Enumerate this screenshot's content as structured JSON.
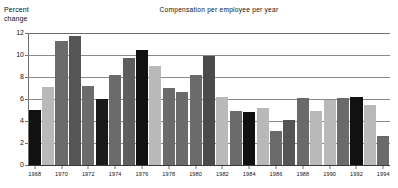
{
  "chart_data": {
    "type": "bar",
    "title": "Compensation per employee per year",
    "ylabel": "Percent\nchange",
    "xlabel": "",
    "ylim": [
      0,
      12
    ],
    "yticks": [
      0,
      2,
      4,
      6,
      8,
      10,
      12
    ],
    "ytick_labels": [
      "0",
      "2",
      "4",
      "6",
      "8",
      "10",
      "12"
    ],
    "grid": true,
    "legend": "none",
    "xtick_labels": [
      "1968",
      "1970",
      "1972",
      "1974",
      "1976",
      "1978",
      "1980",
      "1982",
      "1984",
      "1986",
      "1988",
      "1990",
      "1992",
      "1994"
    ],
    "categories": [
      "1968",
      "1969",
      "1970",
      "1971",
      "1972",
      "1973",
      "1974",
      "1975",
      "1976",
      "1977",
      "1978",
      "1979",
      "1980",
      "1981",
      "1982",
      "1983",
      "1984",
      "1985",
      "1986",
      "1987",
      "1988",
      "1989",
      "1990",
      "1991",
      "1992",
      "1993",
      "1994"
    ],
    "values": [
      5.0,
      7.1,
      11.3,
      11.7,
      7.2,
      6.0,
      8.2,
      9.7,
      10.5,
      9.0,
      7.0,
      6.6,
      8.2,
      9.9,
      6.2,
      4.9,
      4.8,
      5.2,
      3.1,
      4.1,
      6.1,
      4.9,
      5.9,
      6.1,
      6.2,
      5.5,
      2.6
    ],
    "bar_colors": [
      "#111111",
      "#b9b9b9",
      "#6b6b6b",
      "#555555",
      "#6b6b6b",
      "#1a1a1a",
      "#6b6b6b",
      "#5e5e5e",
      "#111111",
      "#b9b9b9",
      "#6b6b6b",
      "#6b6b6b",
      "#6b6b6b",
      "#4a4a4a",
      "#b9b9b9",
      "#6b6b6b",
      "#111111",
      "#b9b9b9",
      "#6b6b6b",
      "#555555",
      "#6b6b6b",
      "#b9b9b9",
      "#b9b9b9",
      "#6b6b6b",
      "#111111",
      "#b9b9b9",
      "#6b6b6b"
    ],
    "palette": {
      "black": "#111111",
      "light_gray": "#b9b9b9",
      "dark_gray": "#6b6b6b",
      "grid": "#8a8a8a",
      "background": "#ffffff"
    }
  }
}
